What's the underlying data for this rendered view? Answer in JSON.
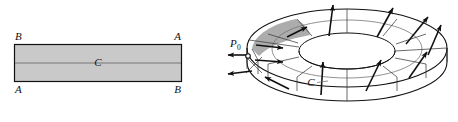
{
  "figure": {
    "kind": "mathematical-diagram",
    "background_color": "#ffffff",
    "ink_color": "#111111",
    "panels": [
      {
        "id": "rectangle-panel",
        "caption": "",
        "shape": "rectangle",
        "fill_color": "#c9c9c9",
        "stroke_color": "#111111",
        "corner_labels": {
          "top_left": "B",
          "top_right": "A",
          "bottom_left": "A",
          "bottom_right": "B"
        },
        "center_line_label": "C"
      },
      {
        "id": "mobius-panel",
        "caption": "",
        "shape": "mobius-band",
        "patch_fill_color": "#9e9e9e",
        "stroke_color": "#111111",
        "point_label": "P",
        "point_label_subscript": "0",
        "curve_label": "C",
        "normal_vector_count": 12,
        "grid_line_count": 12
      }
    ]
  }
}
